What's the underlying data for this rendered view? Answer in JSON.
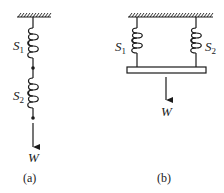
{
  "figure": {
    "panel_a": {
      "caption": "(a)",
      "arrangement": "series",
      "springs": [
        {
          "label": "S",
          "subscript": "1"
        },
        {
          "label": "S",
          "subscript": "2"
        }
      ],
      "load_label": "W"
    },
    "panel_b": {
      "caption": "(b)",
      "arrangement": "parallel",
      "springs": [
        {
          "label": "S",
          "subscript": "1"
        },
        {
          "label": "S",
          "subscript": "2"
        }
      ],
      "load_label": "W"
    },
    "colors": {
      "ink": "#1a1a1a",
      "background": "#ffffff"
    }
  }
}
